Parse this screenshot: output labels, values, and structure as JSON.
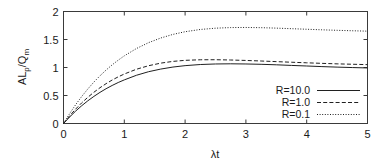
{
  "chart_data": {
    "type": "line",
    "title": "",
    "xlabel": "λt",
    "ylabel": "ALₕ/Qₘ",
    "ylabel_main": "AL",
    "ylabel_sub1": "p",
    "ylabel_mid": "/Q",
    "ylabel_sub2": "m",
    "xlim": [
      0,
      5
    ],
    "ylim": [
      0,
      2
    ],
    "xticks": [
      0,
      1,
      2,
      3,
      4,
      5
    ],
    "xtick_labels": [
      "0",
      "1",
      "2",
      "3",
      "4",
      "5"
    ],
    "yticks": [
      0,
      0.5,
      1,
      1.5,
      2
    ],
    "ytick_labels": [
      "0",
      "0.5",
      "1",
      "1.5",
      "2"
    ],
    "grid": false,
    "legend_position": "lower-right-inside",
    "tick_direction": "in",
    "line_color": "#202020",
    "frame_color": "#3a3a3a",
    "background": "#ffffff",
    "x": [
      0,
      0.1,
      0.2,
      0.3,
      0.4,
      0.5,
      0.6,
      0.7,
      0.8,
      0.9,
      1.0,
      1.2,
      1.4,
      1.6,
      1.8,
      2.0,
      2.25,
      2.5,
      2.75,
      3.0,
      3.25,
      3.5,
      3.75,
      4.0,
      4.25,
      4.5,
      4.75,
      5.0
    ],
    "series": [
      {
        "name": "R=10.0",
        "label": "R=10.0",
        "style": "solid",
        "values": [
          0,
          0.115,
          0.222,
          0.318,
          0.405,
          0.484,
          0.556,
          0.621,
          0.679,
          0.732,
          0.779,
          0.861,
          0.925,
          0.972,
          1.008,
          1.033,
          1.053,
          1.063,
          1.066,
          1.063,
          1.057,
          1.048,
          1.037,
          1.027,
          1.016,
          1.007,
          0.999,
          0.992
        ]
      },
      {
        "name": "R=1.0",
        "label": "R=1.0",
        "style": "dashed",
        "values": [
          0,
          0.135,
          0.258,
          0.369,
          0.468,
          0.558,
          0.639,
          0.711,
          0.776,
          0.833,
          0.884,
          0.969,
          1.032,
          1.078,
          1.109,
          1.128,
          1.138,
          1.139,
          1.134,
          1.126,
          1.116,
          1.105,
          1.094,
          1.084,
          1.074,
          1.065,
          1.058,
          1.051
        ]
      },
      {
        "name": "R=0.1",
        "label": "R=0.1",
        "style": "dotted",
        "values": [
          0,
          0.175,
          0.336,
          0.483,
          0.617,
          0.74,
          0.852,
          0.954,
          1.047,
          1.131,
          1.208,
          1.339,
          1.444,
          1.527,
          1.591,
          1.639,
          1.679,
          1.702,
          1.713,
          1.715,
          1.711,
          1.703,
          1.693,
          1.683,
          1.673,
          1.664,
          1.656,
          1.649
        ]
      }
    ]
  }
}
